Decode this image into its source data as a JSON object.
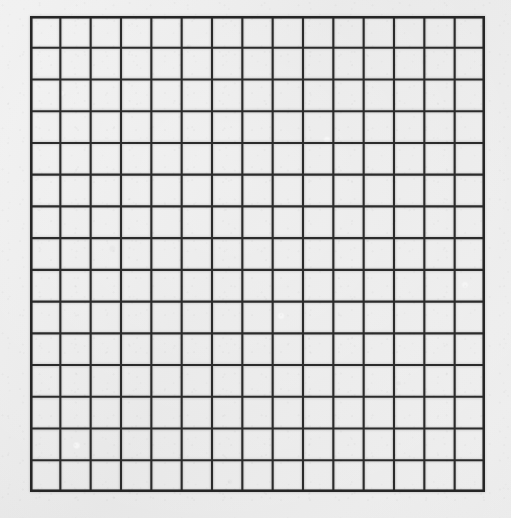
{
  "document": {
    "type": "grid-paper-sheet",
    "title": "Blank square grid sheet",
    "description": "A blank ruled grid drawn on a light gray paper background. No text, labels, axes or data marks are present.",
    "text_content": ""
  },
  "canvas": {
    "width": 511,
    "height": 518,
    "background_color": "#e9e9e9"
  },
  "grid": {
    "columns": 15,
    "rows": 15,
    "cell_width": 30.3,
    "cell_height": 31.7,
    "left": 30,
    "top": 16,
    "right": 485,
    "bottom": 492,
    "width": 455,
    "height": 476,
    "line_color": "#2b2b2b",
    "line_width": 2.1,
    "border_color": "#262626",
    "border_width": 2.4,
    "cell_fill": "none"
  },
  "margins": {
    "left": 30,
    "top": 16,
    "right": 26,
    "bottom": 26
  },
  "chart_data": {
    "type": "table",
    "title": "",
    "xlabel": "",
    "ylabel": "",
    "categories": [],
    "values": [],
    "annotations": [],
    "legend": [],
    "grid": true,
    "note": "Empty 15 x 15 grid; no plotted data, no tick labels."
  }
}
